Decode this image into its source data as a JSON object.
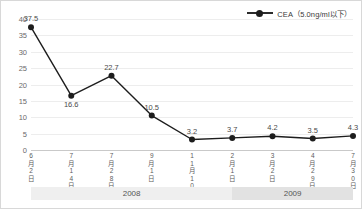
{
  "legend": {
    "marker_icon": "line-dot-marker",
    "label": "CEA（5.0ng/ml以下）"
  },
  "colors": {
    "series": "#1d1d1d",
    "grid": "#ededed",
    "axis": "#c9c9c9",
    "tick_text": "#6a6a6a",
    "band_a": "#efefef",
    "band_b": "#e2e2e2",
    "background": "#ffffff",
    "border": "#d8d8d8"
  },
  "chart_data": {
    "type": "line",
    "title": "",
    "xlabel": "",
    "ylabel": "",
    "ylim": [
      0,
      40
    ],
    "yticks": [
      0,
      5,
      10,
      15,
      20,
      25,
      30,
      35,
      40
    ],
    "grid": true,
    "legend_position": "top-right",
    "categories": [
      "6月2日",
      "7月14日",
      "7月28日",
      "9月1日",
      "11月10日",
      "2月1日",
      "3月2日",
      "4月29日",
      "7月30日"
    ],
    "series": [
      {
        "name": "CEA（5.0ng/ml以下）",
        "values": [
          37.5,
          16.6,
          22.7,
          10.5,
          3.2,
          3.7,
          4.2,
          3.5,
          4.3
        ]
      }
    ],
    "point_labels": [
      "37.5",
      "16.6",
      "22.7",
      "10.5",
      "3.2",
      "3.7",
      "4.2",
      "3.5",
      "4.3"
    ],
    "point_label_positions": [
      "above",
      "below",
      "above",
      "above",
      "above",
      "above",
      "above",
      "above",
      "above"
    ],
    "year_bands": [
      {
        "label": "2008",
        "span": 5
      },
      {
        "label": "2009",
        "span": 4
      }
    ]
  }
}
